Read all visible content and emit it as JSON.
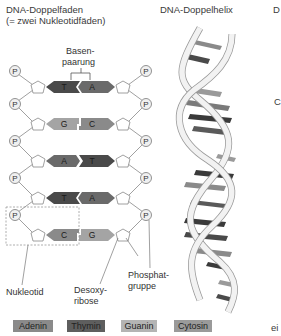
{
  "titles": {
    "left_line1": "DNA-Doppelfaden",
    "left_line2": "(= zwei Nukleotidfäden)",
    "middle": "DNA-Doppelhelix",
    "right_cut": "D"
  },
  "labels": {
    "basenpaarung_line1": "Basen-",
    "basenpaarung_line2": "paarung",
    "nukleotid": "Nukleotid",
    "desoxyribose_line1": "Desoxy-",
    "desoxyribose_line2": "ribose",
    "phosphat_line1": "Phosphat-",
    "phosphat_line2": "gruppe",
    "right_cut_c": "C",
    "right_cut_bottom": "ei"
  },
  "phosphate_symbol": "P",
  "base_pairs": [
    {
      "left": "T",
      "right": "A"
    },
    {
      "left": "G",
      "right": "C"
    },
    {
      "left": "A",
      "right": "T"
    },
    {
      "left": "T",
      "right": "A"
    },
    {
      "left": "C",
      "right": "G"
    }
  ],
  "colors": {
    "A": "#7a7a7a",
    "T": "#4a4a4a",
    "G": "#a8a8a8",
    "C": "#8e8e8e",
    "backbone": "#e8e8e8",
    "line": "#777777"
  },
  "legend": [
    {
      "label": "Adenin",
      "color": "#8a8a8a"
    },
    {
      "label": "Thymin",
      "color": "#5e5e5e"
    },
    {
      "label": "Guanin",
      "color": "#b4b4b4"
    },
    {
      "label": "Cytosin",
      "color": "#9a9a9a"
    }
  ]
}
